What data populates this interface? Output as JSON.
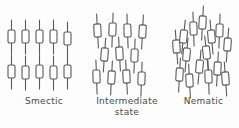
{
  "figure": {
    "background_color": "#fdfdfd",
    "stroke_color": "#5a5a5a",
    "molecule_fill": "#ffffff",
    "molecule_glyph": "rod-with-hollow-rectangle"
  },
  "panels": [
    {
      "id": "smectic",
      "label": "Smectic",
      "label_line2": "",
      "description": "Ordered molecules arranged in two distinct parallel layers, all rods vertical",
      "rows": 2,
      "molecules_per_row": 5,
      "molecules": [
        {
          "x": 8,
          "y": 20,
          "angle": 0
        },
        {
          "x": 22,
          "y": 20,
          "angle": 0
        },
        {
          "x": 36,
          "y": 20,
          "angle": 0
        },
        {
          "x": 50,
          "y": 20,
          "angle": 0
        },
        {
          "x": 64,
          "y": 22,
          "angle": 0
        },
        {
          "x": 8,
          "y": 55,
          "angle": 0
        },
        {
          "x": 22,
          "y": 56,
          "angle": 0
        },
        {
          "x": 36,
          "y": 55,
          "angle": 0
        },
        {
          "x": 50,
          "y": 56,
          "angle": 0
        },
        {
          "x": 64,
          "y": 55,
          "angle": 0
        }
      ]
    },
    {
      "id": "intermediate",
      "label": "Intermediate",
      "label_line2": "state",
      "description": "Partially ordered: three loose layers with staggered offsets and small tilts",
      "rows": 3,
      "molecules_per_row": 4,
      "molecules": [
        {
          "x": 10,
          "y": 14,
          "angle": -3
        },
        {
          "x": 25,
          "y": 13,
          "angle": 2
        },
        {
          "x": 40,
          "y": 14,
          "angle": -2
        },
        {
          "x": 55,
          "y": 15,
          "angle": 3
        },
        {
          "x": 17,
          "y": 38,
          "angle": 4
        },
        {
          "x": 32,
          "y": 37,
          "angle": -3
        },
        {
          "x": 47,
          "y": 39,
          "angle": 2
        },
        {
          "x": 9,
          "y": 60,
          "angle": -2
        },
        {
          "x": 24,
          "y": 61,
          "angle": 3
        },
        {
          "x": 39,
          "y": 60,
          "angle": -3
        },
        {
          "x": 54,
          "y": 62,
          "angle": 2
        }
      ]
    },
    {
      "id": "nematic",
      "label": "Nematic",
      "label_line2": "",
      "description": "Molecules randomly positioned with no layer order, but roughly aligned along one axis",
      "rows": 0,
      "molecules_per_row": 0,
      "molecules": [
        {
          "x": 5,
          "y": 30,
          "angle": -4
        },
        {
          "x": 15,
          "y": 38,
          "angle": 5
        },
        {
          "x": 22,
          "y": 12,
          "angle": -2
        },
        {
          "x": 31,
          "y": 6,
          "angle": 3
        },
        {
          "x": 40,
          "y": 20,
          "angle": -5
        },
        {
          "x": 48,
          "y": 14,
          "angle": 2
        },
        {
          "x": 56,
          "y": 28,
          "angle": 4
        },
        {
          "x": 8,
          "y": 58,
          "angle": 3
        },
        {
          "x": 18,
          "y": 64,
          "angle": -3
        },
        {
          "x": 28,
          "y": 50,
          "angle": 5
        },
        {
          "x": 37,
          "y": 60,
          "angle": -2
        },
        {
          "x": 46,
          "y": 52,
          "angle": 3
        },
        {
          "x": 54,
          "y": 62,
          "angle": -4
        },
        {
          "x": 12,
          "y": 20,
          "angle": 6
        },
        {
          "x": 35,
          "y": 36,
          "angle": -6
        }
      ]
    }
  ]
}
